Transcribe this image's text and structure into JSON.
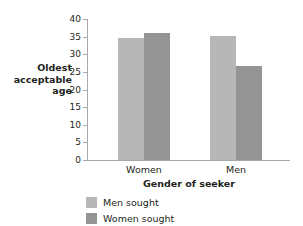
{
  "chart_data": {
    "type": "bar",
    "title": "",
    "subtitle": "",
    "xlabel": "Gender of seeker",
    "ylabel": "Oldest acceptable age",
    "ylabel_lines": [
      "Oldest",
      "acceptable",
      "age"
    ],
    "categories": [
      "Women",
      "Men"
    ],
    "series": [
      {
        "name": "Men sought",
        "color": "#b7b7b7",
        "values": [
          34.5,
          35.2
        ]
      },
      {
        "name": "Women sought",
        "color": "#949494",
        "values": [
          36.0,
          26.8
        ]
      }
    ],
    "ylim": [
      0,
      40
    ],
    "yticks": [
      0,
      5,
      10,
      15,
      20,
      25,
      30,
      35,
      40
    ],
    "ytick_labels": [
      "0",
      "5",
      "10",
      "15",
      "20",
      "25",
      "30",
      "35",
      "40"
    ],
    "grid": false,
    "legend_position": "bottom-left",
    "axis_color": "#a7a9ac"
  }
}
